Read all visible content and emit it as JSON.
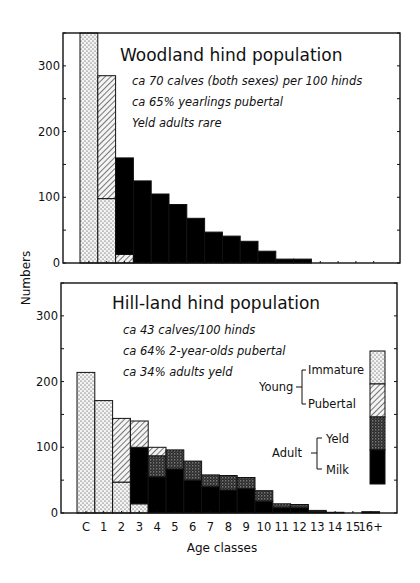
{
  "figure": {
    "y_axis_label": "Numbers",
    "x_axis_label": "Age classes",
    "legend": {
      "young_label": "Young",
      "young_items": [
        "Immature",
        "Pubertal"
      ],
      "adult_label": "Adult",
      "adult_items": [
        "Yeld",
        "Milk"
      ]
    }
  },
  "chart_data": [
    {
      "type": "bar",
      "stacked": true,
      "title": "Woodland hind population",
      "annotations": [
        "ca 70 calves (both sexes) per 100 hinds",
        "ca 65% yearlings pubertal",
        "Yeld adults rare"
      ],
      "xlabel": "Age classes",
      "ylabel": "Numbers",
      "ylim": [
        0,
        350
      ],
      "yticks": [
        0,
        100,
        200,
        300
      ],
      "categories": [
        "C",
        "1",
        "2",
        "3",
        "4",
        "5",
        "6",
        "7",
        "8",
        "9",
        "10",
        "11",
        "12",
        "13",
        "14",
        "15",
        "16+"
      ],
      "series": [
        {
          "name": "Immature",
          "pattern": "dots",
          "values": [
            350,
            98,
            0,
            0,
            0,
            0,
            0,
            0,
            0,
            0,
            0,
            0,
            0,
            0,
            0,
            0,
            0
          ]
        },
        {
          "name": "Pubertal",
          "pattern": "hatch",
          "values": [
            0,
            187,
            13,
            0,
            0,
            0,
            0,
            0,
            0,
            0,
            0,
            0,
            0,
            0,
            0,
            0,
            0
          ]
        },
        {
          "name": "Yeld",
          "pattern": "dense-dots",
          "values": [
            0,
            0,
            0,
            0,
            0,
            0,
            0,
            0,
            0,
            0,
            0,
            0,
            0,
            0,
            0,
            0,
            0
          ]
        },
        {
          "name": "Milk",
          "pattern": "solid",
          "values": [
            0,
            0,
            147,
            125,
            105,
            89,
            68,
            47,
            41,
            33,
            18,
            6,
            6,
            0,
            0,
            0,
            0
          ]
        }
      ],
      "note": "Calf bar (C) extends beyond the top of the axis (>350)"
    },
    {
      "type": "bar",
      "stacked": true,
      "title": "Hill-land hind population",
      "annotations": [
        "ca 43 calves/100 hinds",
        "ca 64% 2-year-olds pubertal",
        "ca 34% adults yeld"
      ],
      "xlabel": "Age classes",
      "ylabel": "Numbers",
      "ylim": [
        0,
        350
      ],
      "yticks": [
        0,
        100,
        200,
        300
      ],
      "categories": [
        "C",
        "1",
        "2",
        "3",
        "4",
        "5",
        "6",
        "7",
        "8",
        "9",
        "10",
        "11",
        "12",
        "13",
        "14",
        "15",
        "16+"
      ],
      "series": [
        {
          "name": "Immature",
          "pattern": "dots",
          "values": [
            214,
            171,
            47,
            14,
            0,
            0,
            0,
            0,
            0,
            0,
            0,
            0,
            0,
            0,
            0,
            0,
            0
          ]
        },
        {
          "name": "Pubertal",
          "pattern": "hatch",
          "values": [
            0,
            0,
            97,
            40,
            13,
            0,
            0,
            0,
            0,
            0,
            0,
            0,
            0,
            0,
            0,
            0,
            0
          ]
        },
        {
          "name": "Yeld",
          "pattern": "dense-dots",
          "values": [
            0,
            0,
            0,
            0,
            32,
            29,
            29,
            18,
            22,
            17,
            16,
            6,
            5,
            2,
            0,
            0,
            0
          ]
        },
        {
          "name": "Milk",
          "pattern": "solid",
          "values": [
            0,
            0,
            0,
            86,
            55,
            67,
            50,
            40,
            35,
            37,
            18,
            8,
            8,
            2,
            1,
            0,
            2
          ]
        }
      ],
      "stack_order_bottom_to_top": [
        "Immature",
        "Milk",
        "Yeld",
        "Pubertal"
      ]
    }
  ]
}
